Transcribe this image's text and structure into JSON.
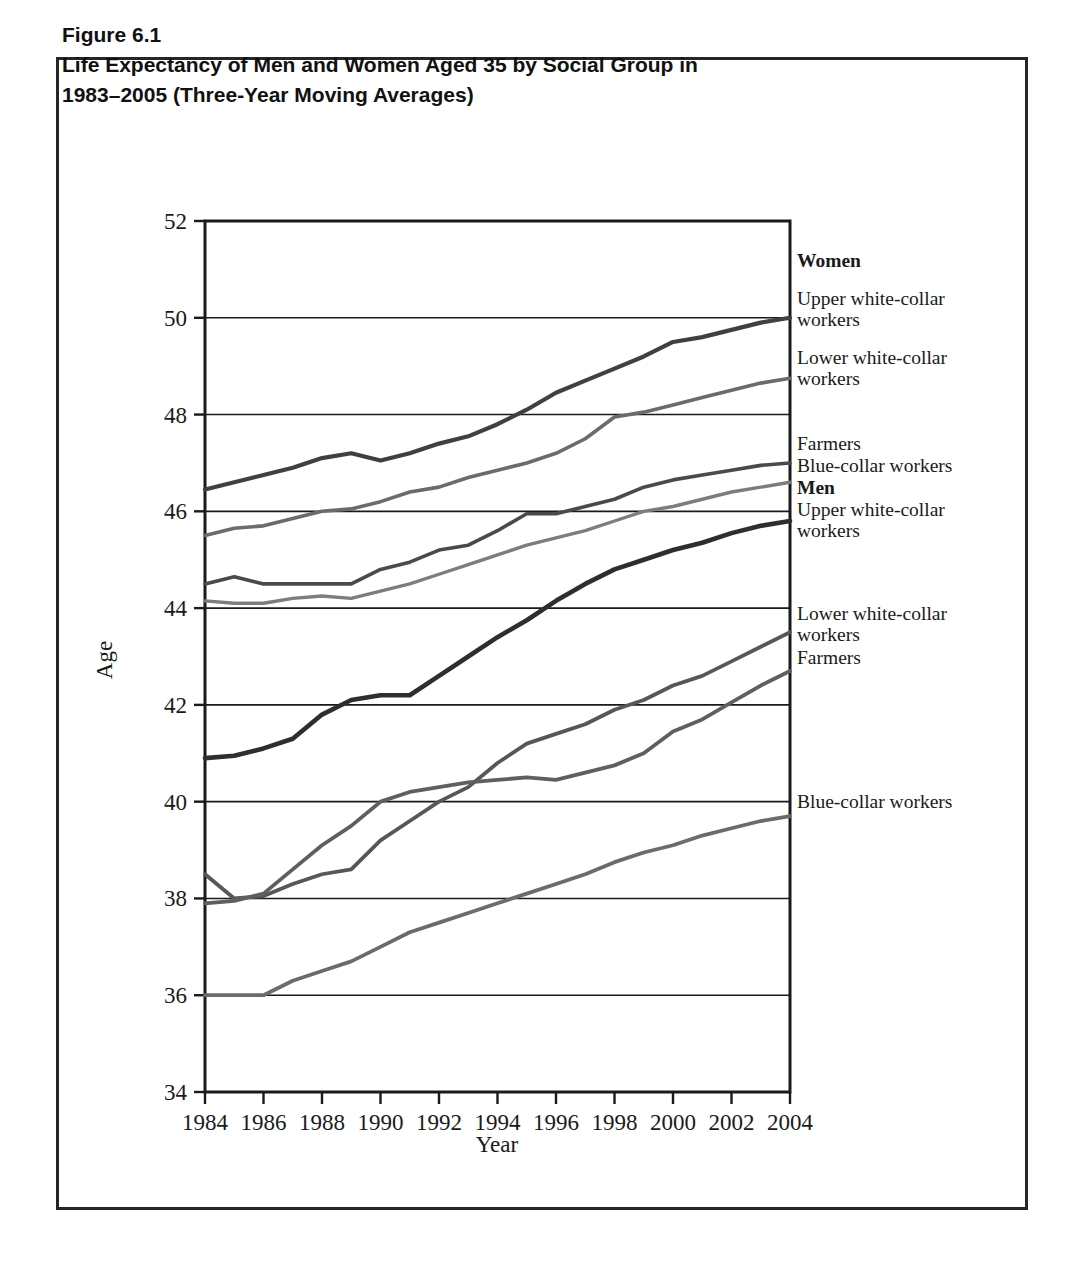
{
  "figure": {
    "number_label": "Figure 6.1",
    "title_line1": "Life Expectancy of Men and Women Aged 35 by Social Group in",
    "title_line2": "1983–2005 (Three-Year Moving Averages)"
  },
  "legend": {
    "women_header": "Women",
    "men_header": "Men",
    "women_upper": "Upper white-collar\nworkers",
    "women_lower": "Lower white-collar\nworkers",
    "women_farmers": "Farmers",
    "women_blue": "Blue-collar workers",
    "men_upper": "Upper white-collar\nworkers",
    "men_lower": "Lower white-collar\nworkers",
    "men_farmers": "Farmers",
    "men_blue": "Blue-collar workers"
  },
  "chart_data": {
    "type": "line",
    "title": "Life Expectancy of Men and Women Aged 35 by Social Group in 1983–2005 (Three-Year Moving Averages)",
    "xlabel": "Year",
    "ylabel": "Age",
    "xlim": [
      1984,
      2004
    ],
    "ylim": [
      34,
      52
    ],
    "yticks": [
      34,
      36,
      38,
      40,
      42,
      44,
      46,
      48,
      50,
      52
    ],
    "xticks": [
      1984,
      1986,
      1988,
      1990,
      1992,
      1994,
      1996,
      1998,
      2000,
      2002,
      2004
    ],
    "grid": "horizontal",
    "legend_position": "right-inline-labels",
    "x": [
      1984,
      1985,
      1986,
      1987,
      1988,
      1989,
      1990,
      1991,
      1992,
      1993,
      1994,
      1995,
      1996,
      1997,
      1998,
      1999,
      2000,
      2001,
      2002,
      2003,
      2004
    ],
    "series": [
      {
        "name": "Women, upper white-collar workers",
        "values": [
          46.45,
          46.6,
          46.75,
          46.9,
          47.1,
          47.2,
          47.05,
          47.2,
          47.4,
          47.55,
          47.8,
          48.1,
          48.45,
          48.7,
          48.95,
          49.2,
          49.5,
          49.6,
          49.75,
          49.9,
          50.0
        ]
      },
      {
        "name": "Women, lower white-collar workers",
        "values": [
          45.5,
          45.65,
          45.7,
          45.85,
          46.0,
          46.05,
          46.2,
          46.4,
          46.5,
          46.7,
          46.85,
          47.0,
          47.2,
          47.5,
          47.95,
          48.05,
          48.2,
          48.35,
          48.5,
          48.65,
          48.75
        ]
      },
      {
        "name": "Women, farmers",
        "values": [
          44.5,
          44.65,
          44.5,
          44.5,
          44.5,
          44.5,
          44.8,
          44.95,
          45.2,
          45.3,
          45.6,
          45.95,
          45.95,
          46.1,
          46.25,
          46.5,
          46.65,
          46.75,
          46.85,
          46.95,
          47.0
        ]
      },
      {
        "name": "Women, blue-collar workers",
        "values": [
          44.15,
          44.1,
          44.1,
          44.2,
          44.25,
          44.2,
          44.35,
          44.5,
          44.7,
          44.9,
          45.1,
          45.3,
          45.45,
          45.6,
          45.8,
          46.0,
          46.1,
          46.25,
          46.4,
          46.5,
          46.6
        ]
      },
      {
        "name": "Men, upper white-collar workers",
        "values": [
          40.9,
          40.95,
          41.1,
          41.3,
          41.8,
          42.1,
          42.2,
          42.2,
          42.6,
          43.0,
          43.4,
          43.75,
          44.15,
          44.5,
          44.8,
          45.0,
          45.2,
          45.35,
          45.55,
          45.7,
          45.8
        ]
      },
      {
        "name": "Men, lower white-collar workers",
        "values": [
          38.5,
          38.0,
          38.05,
          38.3,
          38.5,
          38.6,
          39.2,
          39.6,
          40.0,
          40.3,
          40.8,
          41.2,
          41.4,
          41.6,
          41.9,
          42.1,
          42.4,
          42.6,
          42.9,
          43.2,
          43.5
        ]
      },
      {
        "name": "Men, farmers",
        "values": [
          37.9,
          37.95,
          38.1,
          38.6,
          39.1,
          39.5,
          40.0,
          40.2,
          40.3,
          40.4,
          40.45,
          40.5,
          40.45,
          40.6,
          40.75,
          41.0,
          41.45,
          41.7,
          42.05,
          42.4,
          42.7
        ]
      },
      {
        "name": "Men, blue-collar workers",
        "values": [
          36.0,
          36.0,
          36.0,
          36.3,
          36.5,
          36.7,
          37.0,
          37.3,
          37.5,
          37.7,
          37.9,
          38.1,
          38.3,
          38.5,
          38.75,
          38.95,
          39.1,
          39.3,
          39.45,
          39.6,
          39.7
        ]
      }
    ]
  }
}
